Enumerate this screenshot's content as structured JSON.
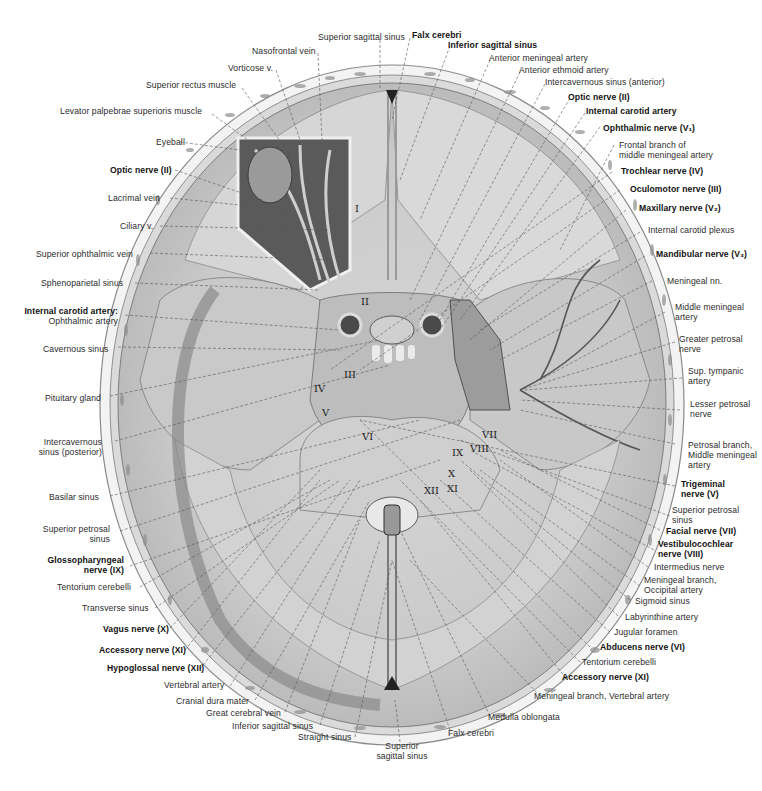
{
  "figure": {
    "roman_numeral_markers": [
      "I",
      "II",
      "III",
      "IV",
      "V",
      "VI",
      "VII",
      "VIII",
      "IX",
      "X",
      "XI",
      "XII"
    ]
  },
  "labels_top": [
    {
      "text": "Superior sagittal sinus",
      "bold": false
    },
    {
      "text": "Nasofrontal vein",
      "bold": false
    },
    {
      "text": "Vorticose v.",
      "bold": false
    },
    {
      "text": "Superior rectus muscle",
      "bold": false
    },
    {
      "text": "Levator palpebrae superioris muscle",
      "bold": false
    },
    {
      "text": "Falx cerebri",
      "bold": true
    },
    {
      "text": "Inferior sagittal sinus",
      "bold": true
    },
    {
      "text": "Anterior meningeal artery",
      "bold": false
    },
    {
      "text": "Anterior ethmoid artery",
      "bold": false
    },
    {
      "text": "Intercavernous sinus (anterior)",
      "bold": false
    }
  ],
  "labels_left": [
    {
      "text": "Eyeball",
      "bold": false
    },
    {
      "text": "Optic nerve (II)",
      "bold": true
    },
    {
      "text": "Lacrimal vein",
      "bold": false
    },
    {
      "text": "Ciliary v.",
      "bold": false
    },
    {
      "text": "Superior ophthalmic vein",
      "bold": false
    },
    {
      "text": "Sphenoparietal sinus",
      "bold": false
    },
    {
      "line1": "Internal carotid artery:",
      "line2": "Ophthalmic artery",
      "bold": true
    },
    {
      "text": "Cavernous sinus",
      "bold": false
    },
    {
      "text": "Pituitary gland",
      "bold": false
    },
    {
      "line1": "Intercavernous",
      "line2": "sinus (posterior)",
      "bold": false
    },
    {
      "text": "Basilar sinus",
      "bold": false
    },
    {
      "line1": "Superior petrosal",
      "line2": "sinus",
      "bold": false
    },
    {
      "line1": "Glossopharyngeal",
      "line2": "nerve (IX)",
      "bold": true
    },
    {
      "text": "Tentorium cerebelli",
      "bold": false
    },
    {
      "text": "Transverse sinus",
      "bold": false
    },
    {
      "text": "Vagus nerve (X)",
      "bold": true
    },
    {
      "text": "Accessory nerve (XI)",
      "bold": true
    },
    {
      "text": "Hypoglossal nerve (XII)",
      "bold": true
    },
    {
      "text": "Vertebral artery",
      "bold": false
    },
    {
      "text": "Cranial dura mater",
      "bold": false
    },
    {
      "text": "Great cerebral vein",
      "bold": false
    },
    {
      "text": "Inferior sagittal sinus",
      "bold": false
    },
    {
      "text": "Straight sinus",
      "bold": false
    }
  ],
  "labels_right": [
    {
      "text": "Optic nerve (II)",
      "bold": true
    },
    {
      "text": "Internal carotid artery",
      "bold": true
    },
    {
      "text": "Ophthalmic nerve (V₁)",
      "bold": true
    },
    {
      "line1": "Frontal branch of",
      "line2": "middle meningeal artery",
      "bold": false
    },
    {
      "text": "Trochlear nerve (IV)",
      "bold": true
    },
    {
      "text": "Oculomotor nerve (III)",
      "bold": true
    },
    {
      "text": "Maxillary nerve (V₂)",
      "bold": true
    },
    {
      "text": "Internal carotid plexus",
      "bold": false
    },
    {
      "text": "Mandibular nerve (V₃)",
      "bold": true
    },
    {
      "text": "Meningeal nn.",
      "bold": false
    },
    {
      "line1": "Middle meningeal",
      "line2": "artery",
      "bold": false
    },
    {
      "line1": "Greater petrosal",
      "line2": "nerve",
      "bold": false
    },
    {
      "line1": "Sup. tympanic",
      "line2": "artery",
      "bold": false
    },
    {
      "line1": "Lesser petrosal",
      "line2": "nerve",
      "bold": false
    },
    {
      "line1": "Petrosal branch,",
      "line2": "Middle meningeal",
      "line3": "artery",
      "bold": false
    },
    {
      "line1": "Trigeminal",
      "line2": "nerve (V)",
      "bold": true
    },
    {
      "line1": "Superior petrosal",
      "line2": "sinus",
      "bold": false
    },
    {
      "text": "Facial nerve (VII)",
      "bold": true
    },
    {
      "line1": "Vestibulocochlear",
      "line2": "nerve (VIII)",
      "bold": true
    },
    {
      "text": "Intermedius nerve",
      "bold": false
    },
    {
      "line1": "Meningeal branch,",
      "line2": "Occipital artery",
      "bold": false
    },
    {
      "text": "Sigmoid sinus",
      "bold": false
    },
    {
      "text": "Labyrinthine artery",
      "bold": false
    },
    {
      "text": "Jugular foramen",
      "bold": false
    },
    {
      "text": "Abducens nerve (VI)",
      "bold": true
    },
    {
      "text": "Tentorium cerebelli",
      "bold": false
    },
    {
      "text": "Accessory nerve (XI)",
      "bold": true
    },
    {
      "text": "Meningeal branch, Vertebral artery",
      "bold": false
    }
  ],
  "labels_bottom": [
    {
      "text": "Medulla oblongata",
      "bold": false
    },
    {
      "text": "Falx cerebri",
      "bold": false
    },
    {
      "line1": "Superior",
      "line2": "sagittal sinus",
      "bold": false
    }
  ],
  "colors": {
    "background": "#ffffff",
    "skull_outer": "#bdbdbd",
    "bone": "#e6e6e6",
    "dura": "#cfcfcf",
    "dark": "#3a3a3a",
    "label_text": "#2b2b2b",
    "leader_line": "#555555"
  }
}
